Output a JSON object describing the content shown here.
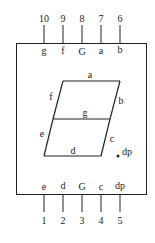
{
  "diagram": {
    "title": "",
    "colors": {
      "stroke": "#222222",
      "background": "#ffffff"
    },
    "top_pins": [
      {
        "number": "10",
        "label": "g",
        "x": 44
      },
      {
        "number": "9",
        "label": "f",
        "x": 63
      },
      {
        "number": "8",
        "label": "G",
        "x": 82
      },
      {
        "number": "7",
        "label": "a",
        "x": 101
      },
      {
        "number": "6",
        "label": "b",
        "x": 120
      }
    ],
    "bottom_pins": [
      {
        "number": "1",
        "label": "e",
        "x": 44
      },
      {
        "number": "2",
        "label": "d",
        "x": 63
      },
      {
        "number": "3",
        "label": "G",
        "x": 82
      },
      {
        "number": "4",
        "label": "c",
        "x": 101
      },
      {
        "number": "5",
        "label": "dp",
        "x": 120
      }
    ],
    "segments": {
      "a": "a",
      "b": "b",
      "c": "c",
      "d": "d",
      "e": "e",
      "f": "f",
      "g": "g",
      "dp": "dp"
    }
  }
}
